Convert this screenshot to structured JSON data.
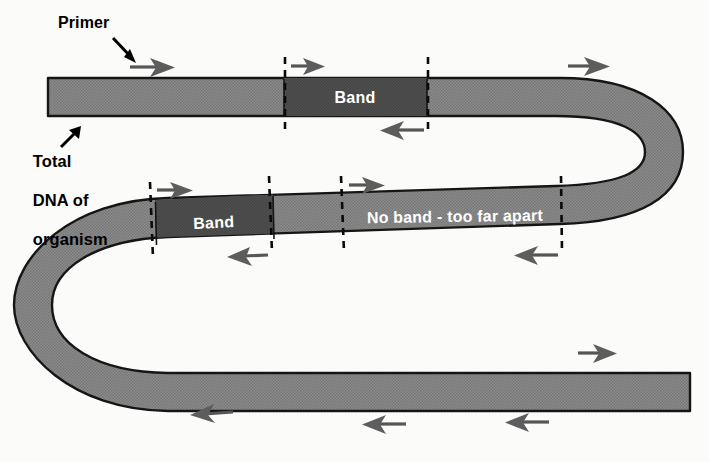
{
  "figure": {
    "background_color": "#fbfbfa",
    "strand_fill": "#868686",
    "band_fill": "#4a4a4a",
    "outline_color": "#111111",
    "arrow_color": "#555555",
    "dash_color": "#000000",
    "text_color_on_strand": "#ffffff"
  },
  "labels": {
    "primer": "Primer",
    "total_dna_line1": "Total",
    "total_dna_line2": "DNA of",
    "total_dna_line3": "organism"
  },
  "strand_labels": {
    "band_top": "Band",
    "band_middle": "Band",
    "no_band": "No band - too far apart"
  },
  "icons": {
    "primer_pointer": "pointer-arrow-icon",
    "total_dna_pointer": "pointer-arrow-up-right-icon",
    "forward_primer": "right-arrow-icon",
    "reverse_primer": "left-arrow-icon",
    "boundary": "dashed-line-icon"
  },
  "annotations": {
    "forward_arrows": 5,
    "reverse_arrows": 6,
    "dashed_boundaries": 10,
    "bands": 2
  }
}
